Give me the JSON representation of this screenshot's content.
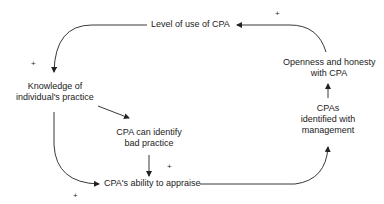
{
  "diagram": {
    "type": "causal-loop",
    "nodes": {
      "level_of_use": "Level of use of CPA",
      "knowledge_line1": "Knowledge of",
      "knowledge_line2": "individual's practice",
      "identify_line1": "CPA can identify",
      "identify_line2": "bad practice",
      "ability": "CPA's ability to appraise",
      "identified_line1": "CPAs",
      "identified_line2": "identified with",
      "identified_line3": "management",
      "openness_line1": "Openness and honesty",
      "openness_line2": "with CPA"
    },
    "signs": {
      "top": "+",
      "left": "+",
      "middle": "+",
      "bottom": "+"
    },
    "edges": [
      {
        "from": "Level of use of CPA",
        "to": "Knowledge of individual's practice",
        "sign": "+"
      },
      {
        "from": "Knowledge of individual's practice",
        "to": "CPA can identify bad practice",
        "sign": ""
      },
      {
        "from": "Knowledge of individual's practice",
        "to": "CPA's ability to appraise",
        "sign": "+"
      },
      {
        "from": "CPA can identify bad practice",
        "to": "CPA's ability to appraise",
        "sign": "+"
      },
      {
        "from": "CPA's ability to appraise",
        "to": "CPAs identified with management",
        "sign": ""
      },
      {
        "from": "CPAs identified with management",
        "to": "Openness and honesty with CPA",
        "sign": ""
      },
      {
        "from": "Openness and honesty with CPA",
        "to": "Level of use of CPA",
        "sign": "+"
      }
    ]
  }
}
